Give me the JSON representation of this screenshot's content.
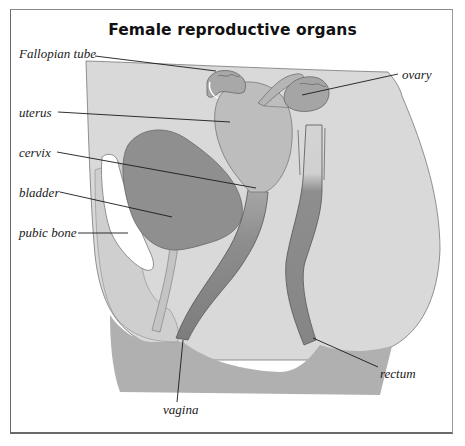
{
  "diagram": {
    "title": "Female reproductive organs",
    "colors": {
      "body_fill": "#d9d9d9",
      "uterus_fill": "#bdbdbd",
      "bladder_fill": "#8f8f8f",
      "vagina_fill": "#8a8a8a",
      "rectum_fill": "#8c8c8c",
      "pubic_bone_fill": "#ffffff",
      "base_fill": "#b0b0b0",
      "outline": "#555555",
      "leader_line": "#1a1a1a",
      "label_text": "#1a1a1a"
    },
    "labels": [
      {
        "id": "fallopian-tube",
        "text": "Fallopian tube"
      },
      {
        "id": "uterus",
        "text": "uterus"
      },
      {
        "id": "cervix",
        "text": "cervix"
      },
      {
        "id": "bladder",
        "text": "bladder"
      },
      {
        "id": "pubic-bone",
        "text": "pubic bone"
      },
      {
        "id": "ovary",
        "text": "ovary"
      },
      {
        "id": "rectum",
        "text": "rectum"
      },
      {
        "id": "vagina",
        "text": "vagina"
      }
    ]
  }
}
